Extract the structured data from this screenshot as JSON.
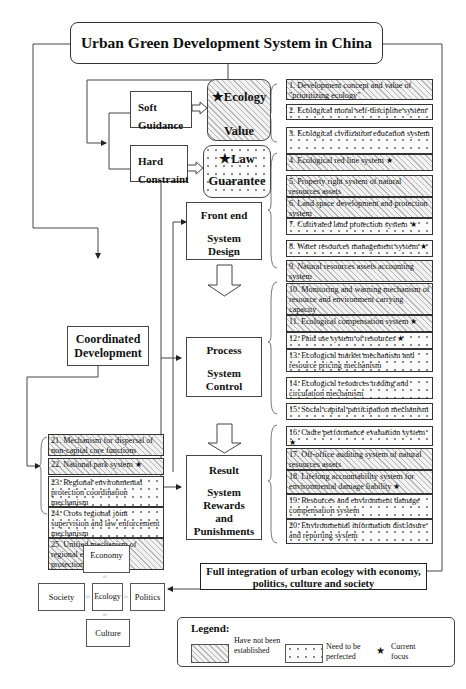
{
  "title": "Urban Green Development System in China",
  "guidance": {
    "soft": "Soft Guidance",
    "hard": "Hard Constraint"
  },
  "pillars": {
    "ecology_top": "★Ecology",
    "ecology_bottom": "Value",
    "law_top": "★Law",
    "law_bottom": "Guarantee"
  },
  "stages": {
    "front_end": [
      "Front end",
      "System",
      "Design"
    ],
    "process": [
      "Process",
      "System",
      "Control"
    ],
    "result": [
      "Result",
      "System",
      "Rewards",
      "and",
      "Punishments"
    ]
  },
  "coordinated": "Coordinated Development",
  "items": [
    {
      "n": "1",
      "text": "1. Development concept and value of \"prioritizing ecology\"",
      "status": "not_established",
      "focus": false
    },
    {
      "n": "2",
      "text": "2. Ecological moral self-discipline system",
      "status": "need_perfected",
      "focus": false
    },
    {
      "n": "3",
      "text": "3. Ecological civilization education system",
      "status": "need_perfected",
      "focus": false
    },
    {
      "n": "4",
      "text": "4. Ecological red line system ★",
      "status": "not_established",
      "focus": true
    },
    {
      "n": "5",
      "text": "5. Property right system of natural resources assets",
      "status": "not_established",
      "focus": false
    },
    {
      "n": "6",
      "text": "6. Land space development and protection system",
      "status": "not_established",
      "focus": false
    },
    {
      "n": "7",
      "text": "7. Cultivated land protection system ★",
      "status": "need_perfected",
      "focus": true
    },
    {
      "n": "8",
      "text": "8. Water resources management system ★",
      "status": "need_perfected",
      "focus": true
    },
    {
      "n": "9",
      "text": "9. Natural resources assets accounting system",
      "status": "not_established",
      "focus": false
    },
    {
      "n": "10",
      "text": "10. Monitoring and warning mechanism of resource and environment carrying capacity",
      "status": "not_established",
      "focus": false
    },
    {
      "n": "11",
      "text": "11. Ecological compensation system ★",
      "status": "not_established",
      "focus": true
    },
    {
      "n": "12",
      "text": "12. Paid use system of resources ★",
      "status": "need_perfected",
      "focus": true
    },
    {
      "n": "13",
      "text": "13. Ecological market mechanism and resource pricing mechanism",
      "status": "need_perfected",
      "focus": false
    },
    {
      "n": "14",
      "text": "14. Ecological resources trading and circulation mechanism",
      "status": "need_perfected",
      "focus": false
    },
    {
      "n": "15",
      "text": "15. Social capital participation mechanism",
      "status": "need_perfected",
      "focus": false
    },
    {
      "n": "16",
      "text": "16. Cadre performance evaluation system ★",
      "status": "need_perfected",
      "focus": true
    },
    {
      "n": "17",
      "text": "17. Off-office auditing system of natural resources assets",
      "status": "not_established",
      "focus": false
    },
    {
      "n": "18",
      "text": "18. Lifelong accountability system for environmental damage liability ★",
      "status": "not_established",
      "focus": true
    },
    {
      "n": "19",
      "text": "19. Resources and environment damage compensation system",
      "status": "need_perfected",
      "focus": false
    },
    {
      "n": "20",
      "text": "20. Environmental information disclosure and reporting system",
      "status": "need_perfected",
      "focus": false
    },
    {
      "n": "21",
      "text": "21. Mechanism for dispersal of non-capital core functions",
      "status": "not_established",
      "focus": false
    },
    {
      "n": "22",
      "text": "22. National park system ★",
      "status": "not_established",
      "focus": true
    },
    {
      "n": "23",
      "text": "23. Regional environmental protection coordination mechanism",
      "status": "need_perfected",
      "focus": false
    },
    {
      "n": "24",
      "text": "24. Cross regional joint supervision and law enforcement mechanism",
      "status": "need_perfected",
      "focus": false
    },
    {
      "n": "25",
      "text": "25. Unified mechanism of regional environmental protection standards",
      "status": "not_established",
      "focus": false
    }
  ],
  "integration": "Full integration of urban ecology with economy, politics, culture and society",
  "integration_lines": [
    "Full integration of urban ecology with economy,",
    "politics, culture and society"
  ],
  "cross": {
    "economy": "Economy",
    "society": "Society",
    "ecology": "Ecology",
    "politics": "Politics",
    "culture": "Culture",
    "connector": "≈"
  },
  "legend": {
    "title": "Legend:",
    "not_established": "Have not been established",
    "need_perfected": "Need to be perfected",
    "star": "★",
    "current_focus": "Current focus"
  }
}
